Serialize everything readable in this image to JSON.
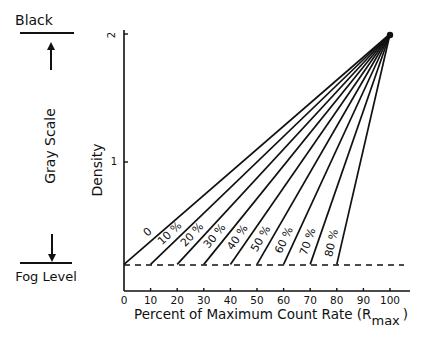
{
  "chart_data": {
    "type": "line",
    "title": "",
    "xlabel": "Percent of Maximum Count Rate (R",
    "xlabel_sub": "max",
    "xlabel_close": ")",
    "ylabel": "Density",
    "xlim": [
      0,
      100
    ],
    "ylim": [
      0,
      2
    ],
    "x_ticks": [
      "0",
      "10",
      "20",
      "30",
      "40",
      "50",
      "60",
      "70",
      "80",
      "90",
      "100"
    ],
    "y_ticks": [
      "1",
      "2"
    ],
    "grid": false,
    "fog_level_density": 0.2,
    "apex": {
      "x": 100,
      "y": 2.0
    },
    "series": [
      {
        "name": "0",
        "x": [
          0,
          100
        ],
        "y": [
          0.2,
          2.0
        ]
      },
      {
        "name": "10 %",
        "x": [
          10,
          100
        ],
        "y": [
          0.2,
          2.0
        ]
      },
      {
        "name": "20 %",
        "x": [
          20,
          100
        ],
        "y": [
          0.2,
          2.0
        ]
      },
      {
        "name": "30 %",
        "x": [
          30,
          100
        ],
        "y": [
          0.2,
          2.0
        ]
      },
      {
        "name": "40 %",
        "x": [
          40,
          100
        ],
        "y": [
          0.2,
          2.0
        ]
      },
      {
        "name": "50 %",
        "x": [
          50,
          100
        ],
        "y": [
          0.2,
          2.0
        ]
      },
      {
        "name": "60 %",
        "x": [
          60,
          100
        ],
        "y": [
          0.2,
          2.0
        ]
      },
      {
        "name": "70 %",
        "x": [
          70,
          100
        ],
        "y": [
          0.2,
          2.0
        ]
      },
      {
        "name": "80 %",
        "x": [
          80,
          100
        ],
        "y": [
          0.2,
          2.0
        ]
      }
    ],
    "annotations": [
      "Black",
      "Gray Scale",
      "Fog Level"
    ]
  },
  "legend": {
    "black": "Black",
    "gray_scale": "Gray Scale",
    "fog_level": "Fog Level"
  }
}
